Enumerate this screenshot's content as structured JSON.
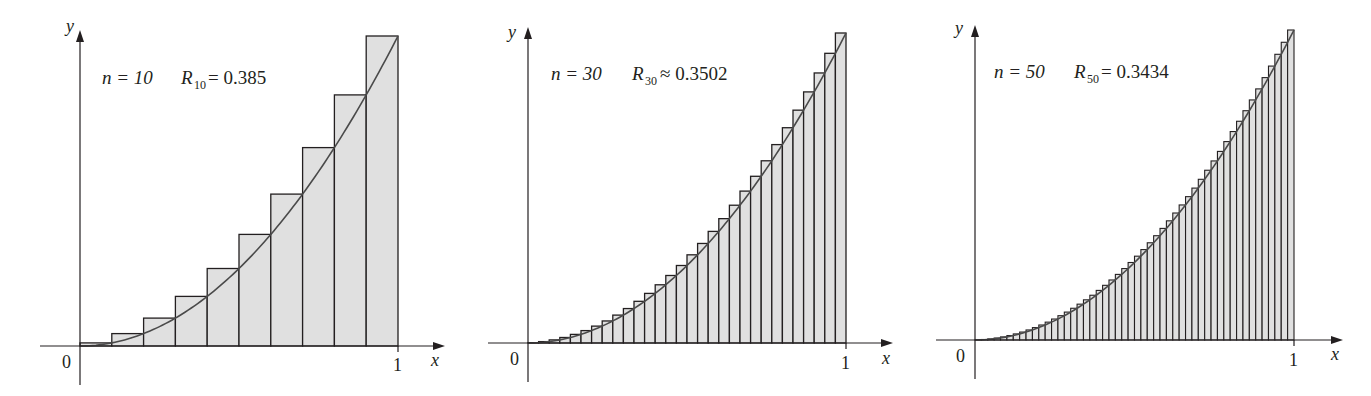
{
  "colors": {
    "background": "#ffffff",
    "bar_fill": "#e0e0e0",
    "bar_stroke": "#231f20",
    "curve": "#4a4a4a",
    "axis": "#231f20",
    "text": "#231f20"
  },
  "chart_data": [
    {
      "type": "bar",
      "description": "Right-endpoint Riemann sum approximation of y = x^2 on [0,1]",
      "function": "x^2",
      "n": 10,
      "annotation": {
        "n_text": "n = 10",
        "R_symbol": "R",
        "R_sub": "10",
        "relation": "=",
        "value": "0.385"
      },
      "xlabel": "x",
      "ylabel": "y",
      "x_ticks": [
        "0",
        "1"
      ],
      "xlim": [
        0,
        1
      ],
      "ylim": [
        0,
        1
      ],
      "values": [
        0.01,
        0.04,
        0.09,
        0.16,
        0.25,
        0.36,
        0.49,
        0.64,
        0.81,
        1.0
      ]
    },
    {
      "type": "bar",
      "description": "Right-endpoint Riemann sum approximation of y = x^2 on [0,1]",
      "function": "x^2",
      "n": 30,
      "annotation": {
        "n_text": "n = 30",
        "R_symbol": "R",
        "R_sub": "30",
        "relation": "≈",
        "value": "0.3502"
      },
      "xlabel": "x",
      "ylabel": "y",
      "x_ticks": [
        "0",
        "1"
      ],
      "xlim": [
        0,
        1
      ],
      "ylim": [
        0,
        1
      ]
    },
    {
      "type": "bar",
      "description": "Right-endpoint Riemann sum approximation of y = x^2 on [0,1]",
      "function": "x^2",
      "n": 50,
      "annotation": {
        "n_text": "n = 50",
        "R_symbol": "R",
        "R_sub": "50",
        "relation": "=",
        "value": "0.3434"
      },
      "xlabel": "x",
      "ylabel": "y",
      "x_ticks": [
        "0",
        "1"
      ],
      "xlim": [
        0,
        1
      ],
      "ylim": [
        0,
        1
      ]
    }
  ],
  "panels": [
    {
      "ox": 80,
      "oy": 346,
      "x1": 398,
      "ytop": 36,
      "ax_left": 40,
      "ax_right": 445,
      "ay_bottom": 385,
      "ay_top": 30
    },
    {
      "ox": 528,
      "oy": 343,
      "x1": 846,
      "ytop": 33,
      "ax_left": 488,
      "ax_right": 893,
      "ay_bottom": 382,
      "ay_top": 27
    },
    {
      "ox": 975,
      "oy": 340,
      "x1": 1294,
      "ytop": 30,
      "ax_left": 936,
      "ax_right": 1343,
      "ay_bottom": 379,
      "ay_top": 25
    }
  ],
  "labels": {
    "panel0": {
      "n": "n = 10",
      "R": "R",
      "sub": "10",
      "rel": "= 0.385",
      "y": "y",
      "x": "x",
      "zero": "0",
      "one": "1"
    },
    "panel1": {
      "n": "n = 30",
      "R": "R",
      "sub": "30",
      "rel": "≈ 0.3502",
      "y": "y",
      "x": "x",
      "zero": "0",
      "one": "1"
    },
    "panel2": {
      "n": "n = 50",
      "R": "R",
      "sub": "50",
      "rel": "= 0.3434",
      "y": "y",
      "x": "x",
      "zero": "0",
      "one": "1"
    }
  }
}
